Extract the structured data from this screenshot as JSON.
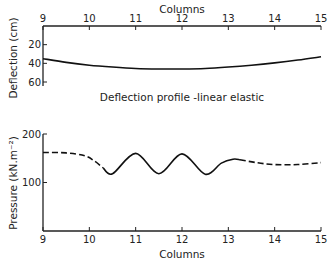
{
  "chart_data": [
    {
      "type": "line",
      "title": "Deflection profile -linear elastic",
      "xlabel": "Columns",
      "ylabel": "Deflection (cm)",
      "xlim": [
        9,
        15
      ],
      "ylim": [
        0,
        60
      ],
      "y_inverted": true,
      "x_axis_position": "top",
      "x_ticks": [
        "9",
        "10",
        "11",
        "12",
        "13",
        "14",
        "15"
      ],
      "y_ticks": [
        "20",
        "40",
        "60"
      ],
      "grid": false,
      "series": [
        {
          "name": "deflection",
          "style": "solid",
          "x": [
            9,
            9.5,
            10,
            10.5,
            11,
            11.5,
            12,
            12.5,
            13,
            13.5,
            14,
            14.5,
            15
          ],
          "y": [
            35,
            39,
            42,
            44,
            45.5,
            46,
            46,
            45.5,
            44,
            42,
            39.5,
            36.5,
            33
          ]
        }
      ]
    },
    {
      "type": "line",
      "title": "",
      "xlabel": "Columns",
      "ylabel": "Pressure (kN.m⁻²)",
      "xlim": [
        9,
        15
      ],
      "ylim": [
        0,
        200
      ],
      "x_ticks": [
        "9",
        "10",
        "11",
        "12",
        "13",
        "14",
        "15"
      ],
      "y_ticks": [
        "100",
        "200"
      ],
      "grid": false,
      "series": [
        {
          "name": "pressure-estimated-left",
          "style": "dashed",
          "x": [
            9,
            9.5,
            9.9,
            10.1,
            10.3
          ],
          "y": [
            162,
            161,
            155,
            145,
            130
          ]
        },
        {
          "name": "pressure-measured",
          "style": "solid",
          "x": [
            10.3,
            10.5,
            11,
            11.5,
            12,
            12.5,
            12.85,
            13.1,
            13.25
          ],
          "y": [
            130,
            118,
            160,
            118,
            159,
            117,
            140,
            148,
            147
          ]
        },
        {
          "name": "pressure-estimated-right",
          "style": "dashed",
          "x": [
            13.25,
            13.6,
            14,
            14.5,
            15
          ],
          "y": [
            147,
            141,
            137,
            137,
            141
          ]
        }
      ]
    }
  ]
}
